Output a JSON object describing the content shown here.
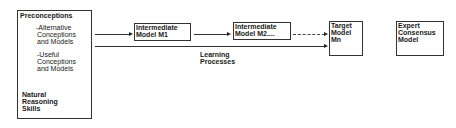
{
  "diagram": {
    "nodes": {
      "preconceptions": {
        "title": "Preconceptions",
        "item1_line1": "-Alternative",
        "item1_line2": "Conceptions",
        "item1_line3": "and Models",
        "item2_line1": "-Useful",
        "item2_line2": "Conceptions",
        "item2_line3": "and Models",
        "footer_line1": "Natural",
        "footer_line2": "Reasoning",
        "footer_line3": "Skills"
      },
      "intermediate_m1": {
        "line1": "Intermediate",
        "line2": "Model M1"
      },
      "intermediate_m2": {
        "line1": "Intermediate",
        "line2": "Model M2...."
      },
      "target": {
        "line1": "Target",
        "line2": "Model",
        "line3": "Mn"
      },
      "expert": {
        "line1": "Expert",
        "line2": "Consensus",
        "line3": "Model"
      }
    },
    "edges": [
      {
        "from": "preconceptions",
        "to": "intermediate_m1",
        "style": "solid"
      },
      {
        "from": "intermediate_m1",
        "to": "intermediate_m2",
        "style": "solid"
      },
      {
        "from": "intermediate_m2",
        "to": "target",
        "style": "dashed"
      },
      {
        "from": "preconceptions",
        "to": "target",
        "style": "solid",
        "label": "Learning Processes"
      }
    ],
    "edge_label": {
      "line1": "Learning",
      "line2": "Processes"
    },
    "colors": {
      "stroke": "#333333",
      "text": "#1a1a1a",
      "background": "#ffffff"
    }
  }
}
